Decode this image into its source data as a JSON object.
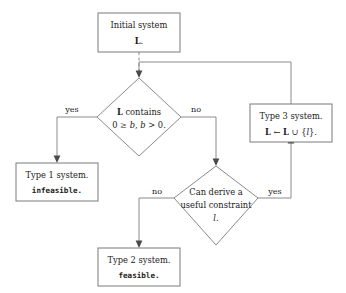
{
  "diagram": {
    "background_color": "#ffffff",
    "line_color": "#8a8a8a",
    "text_color": "#1a1a1a"
  },
  "nodes": {
    "initial": {
      "shape": "rectangle",
      "line1": "Initial system",
      "line2": "L."
    },
    "decision_contains": {
      "shape": "diamond",
      "line1": "L contains",
      "line2": "0 ≥ b, b > 0."
    },
    "type1": {
      "shape": "rectangle",
      "line1": "Type 1 system.",
      "line2": "infeasible."
    },
    "type3": {
      "shape": "rectangle",
      "line1": "Type 3 system.",
      "line2": "L ← L ∪ {l}."
    },
    "decision_derive": {
      "shape": "diamond",
      "line1": "Can derive a",
      "line2": "useful constraint",
      "line3": "l."
    },
    "type2": {
      "shape": "rectangle",
      "line1": "Type 2 system.",
      "line2": "feasible."
    }
  },
  "edge_labels": {
    "contains_yes": "yes",
    "contains_no": "no",
    "derive_no": "no",
    "derive_yes": "yes"
  }
}
